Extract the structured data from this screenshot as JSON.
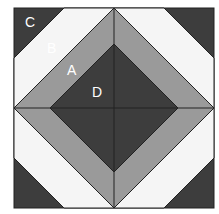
{
  "labels": {
    "C": "C",
    "B": "B",
    "A": "A",
    "D": "D"
  },
  "colors": {
    "C": "#3d3d3d",
    "B": "#f5f5f5",
    "A": "#9a9a9a",
    "D": "#3d3d3d"
  }
}
